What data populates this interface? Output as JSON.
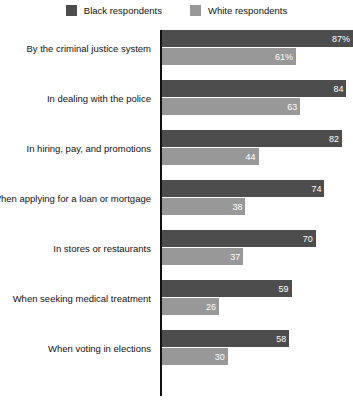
{
  "chart_data": {
    "type": "bar",
    "orientation": "horizontal",
    "title": "",
    "subtitle": "",
    "xlabel": "",
    "ylabel": "",
    "xlim": [
      0,
      87
    ],
    "grid": false,
    "legend_position": "top-center",
    "categories": [
      "By the criminal justice system",
      "In dealing with the police",
      "In hiring, pay, and promotions",
      "When applying for a loan or mortgage",
      "In stores or restaurants",
      "When seeking medical treatment",
      "When voting in elections"
    ],
    "series": [
      {
        "name": "Black respondents",
        "color": "#4d4d4d",
        "values": [
          87,
          84,
          82,
          74,
          70,
          59,
          58
        ],
        "labels": [
          "87%",
          "84",
          "82",
          "74",
          "70",
          "59",
          "58"
        ]
      },
      {
        "name": "White respondents",
        "color": "#989898",
        "values": [
          61,
          63,
          44,
          38,
          37,
          26,
          30
        ],
        "labels": [
          "61%",
          "63",
          "44",
          "38",
          "37",
          "26",
          "30"
        ]
      }
    ]
  },
  "legend": {
    "items": [
      {
        "label": "Black respondents",
        "color": "#4d4d4d",
        "swatch_name": "legend-swatch-black-respondents"
      },
      {
        "label": "White respondents",
        "color": "#989898",
        "swatch_name": "legend-swatch-white-respondents"
      }
    ]
  }
}
